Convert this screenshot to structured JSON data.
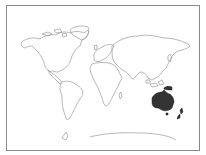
{
  "map": {
    "type": "world-outline",
    "highlighted_region": "Oceania",
    "highlighted_regions": [
      "Australia",
      "New Guinea",
      "New Zealand"
    ],
    "colors": {
      "outline": "#9a9a9a",
      "highlight": "#333333",
      "background": "#ffffff",
      "frame": "#8a8a8a"
    }
  }
}
